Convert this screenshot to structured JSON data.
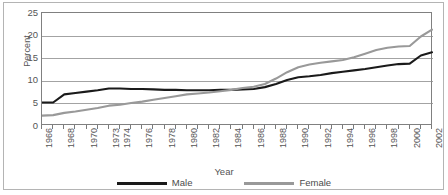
{
  "chart_data": {
    "type": "line",
    "title": "",
    "xlabel": "Year",
    "ylabel": "Percent",
    "ylim": [
      0,
      25
    ],
    "yticks": [
      0,
      5,
      10,
      15,
      20,
      25
    ],
    "grid": true,
    "legend_position": "bottom",
    "x": [
      1966,
      1967,
      1968,
      1969,
      1970,
      1971,
      1973,
      1974,
      1975,
      1976,
      1977,
      1978,
      1979,
      1980,
      1981,
      1982,
      1983,
      1984,
      1985,
      1986,
      1987,
      1988,
      1989,
      1990,
      1991,
      1992,
      1993,
      1994,
      1995,
      1996,
      1997,
      1998,
      1999,
      2000,
      2001,
      2002
    ],
    "tick_labels": [
      "1966",
      "",
      "1968",
      "",
      "1970",
      "",
      "1973",
      "1974",
      "",
      "1976",
      "",
      "1978",
      "",
      "1980",
      "",
      "1982",
      "",
      "1984",
      "",
      "1986",
      "",
      "1988",
      "",
      "1990",
      "",
      "1992",
      "",
      "1994",
      "",
      "1996",
      "",
      "1998",
      "",
      "2000",
      "",
      "2002"
    ],
    "series": [
      {
        "name": "Male",
        "color": "#1a1a1a",
        "values": [
          5.2,
          5.2,
          7.0,
          7.3,
          7.6,
          7.9,
          8.3,
          8.3,
          8.2,
          8.2,
          8.1,
          8.0,
          8.0,
          7.9,
          7.9,
          7.9,
          8.0,
          8.0,
          8.1,
          8.2,
          8.6,
          9.3,
          10.2,
          10.8,
          11.0,
          11.3,
          11.7,
          12.0,
          12.3,
          12.6,
          13.0,
          13.4,
          13.7,
          13.8,
          15.6,
          16.3
        ]
      },
      {
        "name": "Female",
        "color": "#999999",
        "values": [
          2.3,
          2.4,
          2.9,
          3.2,
          3.6,
          4.0,
          4.5,
          4.7,
          5.1,
          5.4,
          5.8,
          6.2,
          6.6,
          7.0,
          7.2,
          7.4,
          7.7,
          8.0,
          8.4,
          8.7,
          9.3,
          10.5,
          11.9,
          13.0,
          13.6,
          14.0,
          14.3,
          14.6,
          15.2,
          16.0,
          16.8,
          17.3,
          17.6,
          17.7,
          19.8,
          21.3
        ]
      }
    ]
  },
  "axis": {
    "y_label": "Percent",
    "x_label": "Year"
  },
  "legend": {
    "items": [
      {
        "label": "Male",
        "color": "#1a1a1a"
      },
      {
        "label": "Female",
        "color": "#999999"
      }
    ]
  }
}
